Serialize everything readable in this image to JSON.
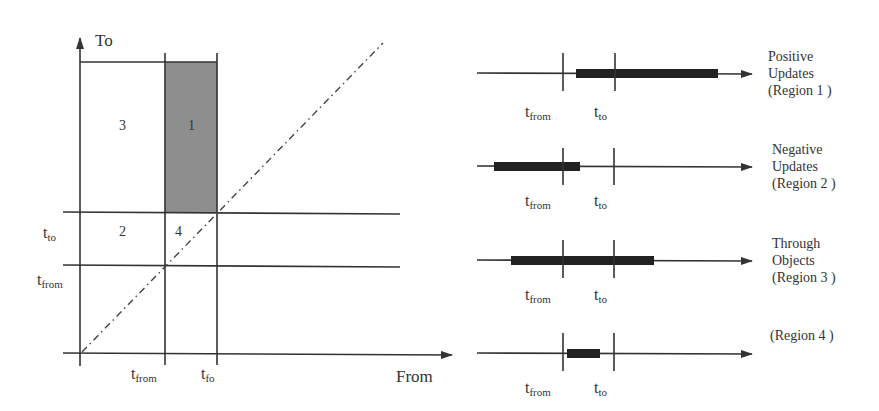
{
  "left_diagram": {
    "y_axis_label": "To",
    "x_axis_label": "From",
    "y_ticks": [
      {
        "base": "t",
        "sub": "to"
      },
      {
        "base": "t",
        "sub": "from"
      }
    ],
    "x_ticks": [
      {
        "base": "t",
        "sub": "from"
      },
      {
        "base": "t",
        "sub": "fo"
      }
    ],
    "regions": [
      {
        "id": "1",
        "label": "1",
        "shaded": true
      },
      {
        "id": "2",
        "label": "2",
        "shaded": false
      },
      {
        "id": "3",
        "label": "3",
        "shaded": false
      },
      {
        "id": "4",
        "label": "4",
        "shaded": false
      }
    ],
    "colors": {
      "shaded": "#8e8e8e",
      "line": "#333333"
    }
  },
  "timelines": [
    {
      "title_lines": [
        "Positive",
        "Updates",
        "(Region 1 )"
      ],
      "tick1": {
        "base": "t",
        "sub": "from"
      },
      "tick2": {
        "base": "t",
        "sub": "to"
      }
    },
    {
      "title_lines": [
        "Negative",
        "Updates",
        "(Region 2 )"
      ],
      "tick1": {
        "base": "t",
        "sub": "from"
      },
      "tick2": {
        "base": "t",
        "sub": "to"
      }
    },
    {
      "title_lines": [
        "Through",
        "Objects",
        "(Region 3 )"
      ],
      "tick1": {
        "base": "t",
        "sub": "from"
      },
      "tick2": {
        "base": "t",
        "sub": "to"
      }
    },
    {
      "title_lines": [
        "(Region 4 )"
      ],
      "tick1": {
        "base": "t",
        "sub": "from"
      },
      "tick2": {
        "base": "t",
        "sub": "to"
      }
    }
  ]
}
